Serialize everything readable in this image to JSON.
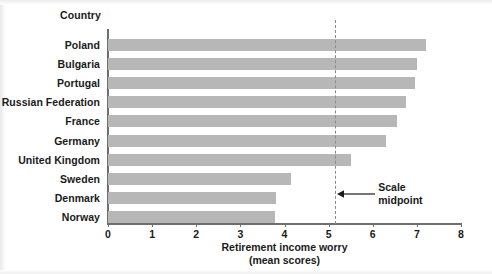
{
  "chart_data": {
    "type": "bar",
    "orientation": "horizontal",
    "title": "",
    "xlabel": "Retirement income worry",
    "xlabel_sub": "(mean scores)",
    "ylabel": "Country",
    "xlim": [
      0,
      8
    ],
    "xticks": [
      0,
      1,
      2,
      3,
      4,
      5,
      6,
      7,
      8
    ],
    "xtick_labels": [
      "0",
      "1",
      "2",
      "3",
      "4",
      "5",
      "6",
      "7",
      "8"
    ],
    "grid": false,
    "legend": "none",
    "bar_color": "#b7b7b7",
    "axis_color": "#6e6e6e",
    "categories": [
      "Poland",
      "Bulgaria",
      "Portugal",
      "Russian Federation",
      "France",
      "Germany",
      "United Kingdom",
      "Sweden",
      "Denmark",
      "Norway"
    ],
    "values": [
      7.2,
      7.0,
      6.95,
      6.75,
      6.55,
      6.3,
      5.5,
      4.15,
      3.8,
      3.78
    ],
    "annotations": [
      {
        "name": "scale-midpoint",
        "text_line1": "Scale",
        "text_line2": "midpoint",
        "value": 5.15,
        "line_style": "dashed",
        "line_color": "#8a8a8a"
      }
    ]
  }
}
